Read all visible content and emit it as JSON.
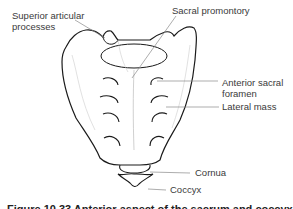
{
  "figure": {
    "labels": {
      "superior_articular_processes_line1": "Superior articular",
      "superior_articular_processes_line2": "processes",
      "sacral_promontory": "Sacral promontory",
      "anterior_sacral_foramen_line1": "Anterior sacral",
      "anterior_sacral_foramen_line2": "foramen",
      "lateral_mass": "Lateral mass",
      "cornua": "Cornua",
      "coccyx": "Coccyx"
    },
    "caption": "Figure 10.33 Anterior aspect of the sacrum and coccyx"
  },
  "colors": {
    "outline": "#1a1a1a",
    "leader_line": "#8a8a8a",
    "label_text": "#3a3a3a",
    "background": "#ffffff"
  }
}
